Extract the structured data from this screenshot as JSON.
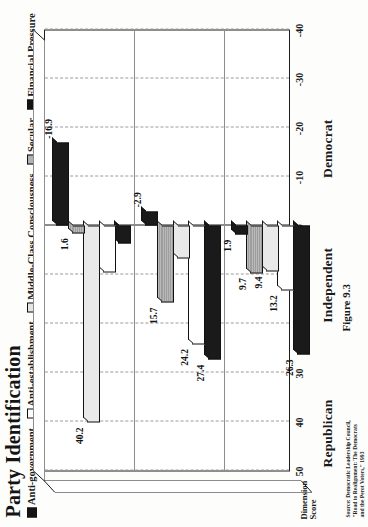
{
  "figure": {
    "title": "Party Identification",
    "caption": "Figure 9.3",
    "source": "Source: Democratic Leadership Council,\n\"Road to Realignment: The Democrats\nand the Perot Voters,\" 1993"
  },
  "axis": {
    "name_line1": "Dimension",
    "name_line2": "Score",
    "ticks": [
      "50",
      "40",
      "30",
      "20",
      "10",
      "0",
      "-10",
      "-20",
      "-30",
      "-40"
    ]
  },
  "legend": {
    "items": [
      {
        "label": "Anti-government",
        "swatch": "black"
      },
      {
        "label": "Anti-establishment",
        "swatch": "white"
      },
      {
        "label": "Middle-Class Consciousness",
        "swatch": "lgray"
      },
      {
        "label": "Secular",
        "swatch": "mgray"
      },
      {
        "label": "Financial Pressure",
        "swatch": "black"
      }
    ]
  },
  "categories": [
    "Democrat",
    "Independent",
    "Republican"
  ],
  "chart_data": {
    "type": "bar",
    "orientation": "horizontal",
    "title": "Party Identification",
    "xlabel": "Dimension Score",
    "ylabel": "",
    "xlim": [
      -40,
      50
    ],
    "grid": true,
    "legend_position": "top",
    "categories": [
      "Democrat",
      "Independent",
      "Republican"
    ],
    "series": [
      {
        "name": "Anti-government",
        "values": [
          26.3,
          27.4,
          3.6
        ]
      },
      {
        "name": "Anti-establishment",
        "values": [
          13.2,
          24.2,
          9.6
        ]
      },
      {
        "name": "Middle-Class Consciousness",
        "values": [
          9.4,
          6.7,
          40.2
        ]
      },
      {
        "name": "Secular",
        "values": [
          9.7,
          15.7,
          1.6
        ]
      },
      {
        "name": "Financial Pressure",
        "values": [
          1.9,
          -2.9,
          -16.9
        ]
      }
    ]
  }
}
